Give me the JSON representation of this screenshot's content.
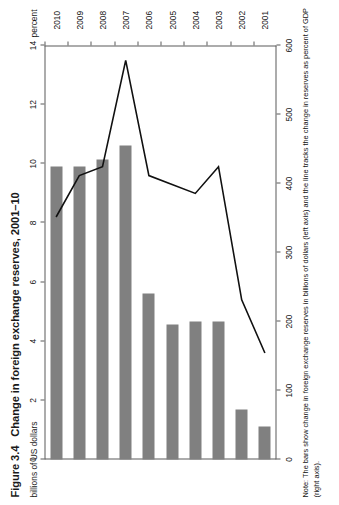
{
  "figure": {
    "number": "Figure 3.4",
    "title": "Change in foreign exchange reserves, 2001–10",
    "left_axis_unit": "billions of US dollars",
    "right_axis_unit": "percent",
    "note": "Note: The bars show change in foreign exchange reserves in billions of dollars (left axis) and the line tracks the change in reserves as percent of GDP (right axis)."
  },
  "colors": {
    "bar": "#808080",
    "line": "#111111",
    "axis": "#5b5b5b",
    "text": "#1a1a1a",
    "background": "#ffffff"
  },
  "chart_data": {
    "type": "bar",
    "title": "Change in foreign exchange reserves, 2001–10",
    "xlabel": "",
    "ylabel": "billions of US dollars",
    "y2label": "percent",
    "categories": [
      "2001",
      "2002",
      "2003",
      "2004",
      "2005",
      "2006",
      "2007",
      "2008",
      "2009",
      "2010"
    ],
    "ylim": [
      0,
      600
    ],
    "y2lim": [
      0,
      14
    ],
    "yticks": [
      0,
      100,
      200,
      300,
      400,
      500,
      600
    ],
    "y2ticks": [
      0,
      2,
      4,
      6,
      8,
      10,
      12,
      14
    ],
    "grid": false,
    "legend": "none",
    "series": [
      {
        "name": "Change in foreign exchange reserves (billions of US dollars)",
        "kind": "bar",
        "axis": "left",
        "values": [
          48,
          72,
          200,
          200,
          195,
          240,
          455,
          435,
          425,
          425
        ]
      },
      {
        "name": "Change in reserves as percent of GDP",
        "kind": "line",
        "axis": "right",
        "values": [
          3.6,
          5.4,
          9.9,
          9.0,
          9.3,
          9.6,
          13.5,
          9.9,
          9.6,
          8.2
        ]
      }
    ]
  }
}
